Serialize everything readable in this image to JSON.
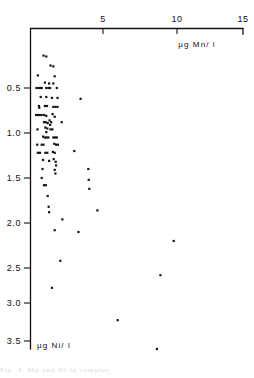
{
  "figure": {
    "background": "#ffffff",
    "ink_color": "#111111",
    "point_color": "#141414",
    "caption_fragment": "Fig. 4.  Mn  and  Ni  in  samples"
  },
  "chart_data": {
    "type": "scatter",
    "title": "",
    "xlabel": "µg  Mn/ l",
    "ylabel": "µg  Ni/ l",
    "xlabel_position": "top-right",
    "ylabel_position": "bottom-left",
    "grid": false,
    "legend": false,
    "x_axis_position": "top",
    "y_axis_position": "left",
    "y_axis_inverted": true,
    "xlim": [
      0,
      15.6
    ],
    "ylim": [
      0,
      3.7
    ],
    "xticks": [
      5,
      10,
      15
    ],
    "xticklabels": [
      "5",
      "10",
      "15"
    ],
    "yticks": [
      0.5,
      1.0,
      1.5,
      2.0,
      2.5,
      3.0,
      3.5
    ],
    "yticklabels": [
      "0.5",
      "1.0",
      "1.5",
      "2.0",
      "2.5",
      "3.0",
      "3.5"
    ],
    "marker": "square",
    "marker_size_px": 2.2,
    "points": [
      [
        0.75,
        0.14
      ],
      [
        0.95,
        0.15
      ],
      [
        1.25,
        0.25
      ],
      [
        1.45,
        0.26
      ],
      [
        0.35,
        0.36
      ],
      [
        1.55,
        0.37
      ],
      [
        0.85,
        0.44
      ],
      [
        1.15,
        0.45
      ],
      [
        1.45,
        0.45
      ],
      [
        0.25,
        0.5
      ],
      [
        0.4,
        0.5
      ],
      [
        0.52,
        0.5
      ],
      [
        0.62,
        0.5
      ],
      [
        0.95,
        0.5
      ],
      [
        1.1,
        0.5
      ],
      [
        1.22,
        0.5
      ],
      [
        1.7,
        0.5
      ],
      [
        0.55,
        0.6
      ],
      [
        0.95,
        0.6
      ],
      [
        1.35,
        0.61
      ],
      [
        1.75,
        0.61
      ],
      [
        3.4,
        0.62
      ],
      [
        0.42,
        0.7
      ],
      [
        0.45,
        0.72
      ],
      [
        0.85,
        0.7
      ],
      [
        1.0,
        0.7
      ],
      [
        1.45,
        0.71
      ],
      [
        1.6,
        0.71
      ],
      [
        1.75,
        0.71
      ],
      [
        0.22,
        0.8
      ],
      [
        0.35,
        0.8
      ],
      [
        0.48,
        0.8
      ],
      [
        0.62,
        0.8
      ],
      [
        0.8,
        0.8
      ],
      [
        0.95,
        0.81
      ],
      [
        1.4,
        0.79
      ],
      [
        1.55,
        0.82
      ],
      [
        0.78,
        0.88
      ],
      [
        0.92,
        0.88
      ],
      [
        1.05,
        0.89
      ],
      [
        1.18,
        0.86
      ],
      [
        1.22,
        0.91
      ],
      [
        1.3,
        0.88
      ],
      [
        2.05,
        0.88
      ],
      [
        0.32,
        0.96
      ],
      [
        0.88,
        0.94
      ],
      [
        0.95,
        0.99
      ],
      [
        1.02,
        0.95
      ],
      [
        1.25,
        0.96
      ],
      [
        1.38,
        0.96
      ],
      [
        0.72,
        1.04
      ],
      [
        0.85,
        1.05
      ],
      [
        0.98,
        1.05
      ],
      [
        1.1,
        1.05
      ],
      [
        1.45,
        1.05
      ],
      [
        1.58,
        1.05
      ],
      [
        1.7,
        1.05
      ],
      [
        0.3,
        1.13
      ],
      [
        0.62,
        1.13
      ],
      [
        0.75,
        1.13
      ],
      [
        1.52,
        1.12
      ],
      [
        1.65,
        1.13
      ],
      [
        1.78,
        1.13
      ],
      [
        0.35,
        1.22
      ],
      [
        0.5,
        1.22
      ],
      [
        0.88,
        1.22
      ],
      [
        1.02,
        1.22
      ],
      [
        1.42,
        1.21
      ],
      [
        1.55,
        1.22
      ],
      [
        2.95,
        1.2
      ],
      [
        0.72,
        1.3
      ],
      [
        1.15,
        1.31
      ],
      [
        1.48,
        1.29
      ],
      [
        1.62,
        1.32
      ],
      [
        1.65,
        1.36
      ],
      [
        0.68,
        1.4
      ],
      [
        1.55,
        1.41
      ],
      [
        1.6,
        1.45
      ],
      [
        3.95,
        1.4
      ],
      [
        0.62,
        1.5
      ],
      [
        3.98,
        1.52
      ],
      [
        0.78,
        1.58
      ],
      [
        0.92,
        1.58
      ],
      [
        4.02,
        1.62
      ],
      [
        1.05,
        1.7
      ],
      [
        1.12,
        1.82
      ],
      [
        1.15,
        1.88
      ],
      [
        4.6,
        1.86
      ],
      [
        2.1,
        1.96
      ],
      [
        1.55,
        2.08
      ],
      [
        3.25,
        2.1
      ],
      [
        10.05,
        2.2
      ],
      [
        1.95,
        2.42
      ],
      [
        9.1,
        2.58
      ],
      [
        1.35,
        2.72
      ],
      [
        6.05,
        3.08
      ],
      [
        8.85,
        3.4
      ]
    ]
  }
}
